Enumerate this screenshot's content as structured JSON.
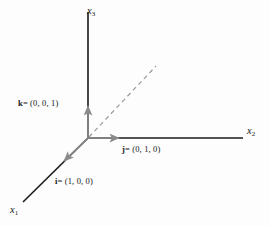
{
  "figure": {
    "background_color": "#fdfdfd",
    "axis_color": "#1a1a1a",
    "vector_color": "#8a8a8a",
    "dashed_color": "#9a9a9a"
  },
  "axes": [
    {
      "name": "x1",
      "label_html": "x",
      "subscript": "1",
      "label_text": "x1",
      "direction": "down-left",
      "color": "#1a1a1a"
    },
    {
      "name": "x2",
      "label_html": "x",
      "subscript": "2",
      "label_text": "x2",
      "direction": "right",
      "color": "#1a1a1a"
    },
    {
      "name": "x3",
      "label_html": "x",
      "subscript": "3",
      "label_text": "x3",
      "direction": "up",
      "color": "#1a1a1a"
    }
  ],
  "vectors": [
    {
      "name": "i",
      "symbol": "i",
      "components": "= (1, 0, 0)",
      "label": "i = (1, 0, 0)",
      "color": "#8a8a8a",
      "direction": "down-left"
    },
    {
      "name": "j",
      "symbol": "j",
      "components": "= (0, 1, 0)",
      "label": "j = (0, 1, 0)",
      "color": "#8a8a8a",
      "direction": "right"
    },
    {
      "name": "k",
      "symbol": "k",
      "components": "= (0, 0, 1)",
      "label": "k = (0, 0, 1)",
      "color": "#8a8a8a",
      "direction": "up"
    }
  ],
  "dashed_line": {
    "name": "diagonal-guide",
    "style": "dashed",
    "color": "#9a9a9a"
  },
  "origin": {
    "x": 88,
    "y": 138
  }
}
